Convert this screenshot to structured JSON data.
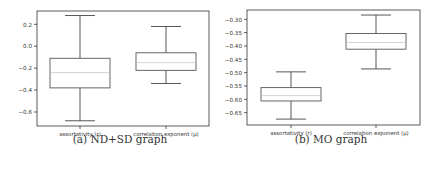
{
  "chart_data": [
    {
      "type": "box",
      "title": "",
      "caption": "(a) ND+SD graph",
      "xlabel": "",
      "ylabel": "",
      "categories": [
        "assortativity (r)",
        "correlation exponent (μ)"
      ],
      "yticks": [
        "0.2",
        "0.0",
        "−0.2",
        "−0.4",
        "−0.6"
      ],
      "ytick_values": [
        0.2,
        0.0,
        -0.2,
        -0.4,
        -0.6
      ],
      "ylim": [
        -0.72,
        0.32
      ],
      "grid": false,
      "series": [
        {
          "name": "assortativity (r)",
          "whisker_low": -0.68,
          "q1": -0.38,
          "median": -0.24,
          "q3": -0.11,
          "whisker_high": 0.28
        },
        {
          "name": "correlation exponent (μ)",
          "whisker_low": -0.34,
          "q1": -0.22,
          "median": -0.15,
          "q3": -0.06,
          "whisker_high": 0.18
        }
      ]
    },
    {
      "type": "box",
      "title": "",
      "caption": "(b) MO graph",
      "xlabel": "",
      "ylabel": "",
      "categories": [
        "assortativity (r)",
        "correlation exponent (μ)"
      ],
      "yticks": [
        "−0.30",
        "−0.35",
        "−0.40",
        "−0.45",
        "−0.50",
        "−0.55",
        "−0.60",
        "−0.65"
      ],
      "ytick_values": [
        -0.3,
        -0.35,
        -0.4,
        -0.45,
        -0.5,
        -0.55,
        -0.6,
        -0.65
      ],
      "ylim": [
        -0.695,
        -0.266
      ],
      "grid": false,
      "series": [
        {
          "name": "assortativity (r)",
          "whisker_low": -0.674,
          "q1": -0.606,
          "median": -0.586,
          "q3": -0.556,
          "whisker_high": -0.497
        },
        {
          "name": "correlation exponent (μ)",
          "whisker_low": -0.486,
          "q1": -0.412,
          "median": -0.387,
          "q3": -0.353,
          "whisker_high": -0.284
        }
      ]
    }
  ],
  "colors": {
    "frame": "#333333",
    "box": "#555555",
    "whisker": "#444444",
    "median": "#c8c8c8",
    "text": "#333333"
  }
}
